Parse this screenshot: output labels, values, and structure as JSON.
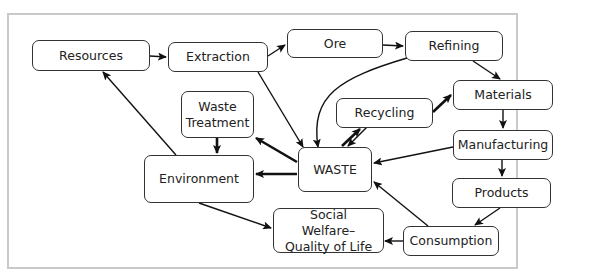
{
  "diagram": {
    "nodes": {
      "resources": "Resources",
      "extraction": "Extraction",
      "ore": "Ore",
      "refining": "Refining",
      "waste_treatment": "Waste Treatment",
      "recycling": "Recycling",
      "materials": "Materials",
      "manufacturing": "Manufacturing",
      "products": "Products",
      "environment": "Environment",
      "waste": "WASTE",
      "social_welfare": "Social Welfare–Quality of Life",
      "consumption": "Consumption"
    },
    "edges": [
      {
        "from": "Resources",
        "to": "Extraction"
      },
      {
        "from": "Extraction",
        "to": "Ore"
      },
      {
        "from": "Ore",
        "to": "Refining"
      },
      {
        "from": "Refining",
        "to": "Materials"
      },
      {
        "from": "Refining",
        "to": "WASTE"
      },
      {
        "from": "Extraction",
        "to": "WASTE"
      },
      {
        "from": "Materials",
        "to": "Manufacturing"
      },
      {
        "from": "Manufacturing",
        "to": "Products"
      },
      {
        "from": "Manufacturing",
        "to": "WASTE"
      },
      {
        "from": "Products",
        "to": "Consumption"
      },
      {
        "from": "Consumption",
        "to": "WASTE"
      },
      {
        "from": "Consumption",
        "to": "Social Welfare–Quality of Life"
      },
      {
        "from": "WASTE",
        "to": "Recycling"
      },
      {
        "from": "Recycling",
        "to": "WASTE"
      },
      {
        "from": "Recycling",
        "to": "Materials"
      },
      {
        "from": "WASTE",
        "to": "Waste Treatment"
      },
      {
        "from": "WASTE",
        "to": "Environment"
      },
      {
        "from": "Waste Treatment",
        "to": "Environment"
      },
      {
        "from": "Environment",
        "to": "Resources"
      },
      {
        "from": "Environment",
        "to": "Social Welfare–Quality of Life"
      }
    ]
  }
}
